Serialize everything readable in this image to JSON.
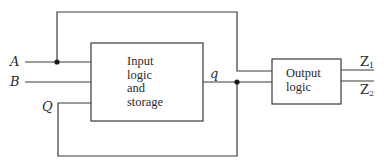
{
  "diagram": {
    "type": "sequential-circuit-block-diagram",
    "inputs": [
      {
        "id": "A",
        "label": "A"
      },
      {
        "id": "B",
        "label": "B"
      },
      {
        "id": "Q",
        "label": "Q"
      }
    ],
    "blocks": [
      {
        "id": "input-logic",
        "lines": [
          "Input",
          "logic",
          "and",
          "storage"
        ]
      },
      {
        "id": "output-logic",
        "lines": [
          "Output",
          "logic"
        ]
      }
    ],
    "internal_signal": {
      "label": "q"
    },
    "outputs": [
      {
        "id": "Z1",
        "label": "Z",
        "sub": "1"
      },
      {
        "id": "Z2",
        "label": "Z",
        "sub": "2"
      }
    ],
    "connections": [
      {
        "from": "A",
        "to": "input-logic",
        "branch_to": "output-logic"
      },
      {
        "from": "B",
        "to": "input-logic"
      },
      {
        "from": "input-logic",
        "signal": "q",
        "to": "output-logic",
        "feedback_as": "Q"
      },
      {
        "from": "output-logic",
        "to": "Z1"
      },
      {
        "from": "output-logic",
        "to": "Z2"
      }
    ]
  }
}
